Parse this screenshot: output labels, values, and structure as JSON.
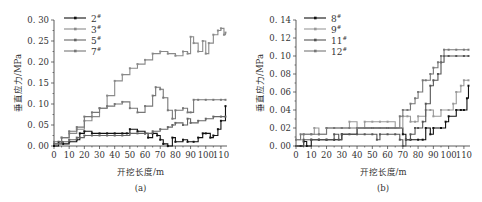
{
  "chart_data": [
    {
      "type": "line",
      "panel": "a",
      "caption": "(a)",
      "title": "",
      "xlabel": "开挖长度/m",
      "ylabel": "垂直应力/MPa",
      "xlim": [
        0,
        114
      ],
      "ylim": [
        0,
        0.3
      ],
      "xticks": [
        0,
        10,
        20,
        30,
        40,
        50,
        60,
        70,
        80,
        90,
        100,
        110
      ],
      "yticks": [
        "0.00",
        "0.05",
        "0.10",
        "0.15",
        "0.20",
        "0.25",
        "0.30"
      ],
      "grid": false,
      "legend_position": "upper-left",
      "series": [
        {
          "name": "2#",
          "color": "#111111",
          "marker": "square",
          "x": [
            0,
            3,
            6,
            10,
            15,
            17,
            20,
            25,
            30,
            35,
            40,
            45,
            48,
            50,
            55,
            60,
            62,
            65,
            68,
            70,
            72,
            75,
            78,
            80,
            85,
            88,
            92,
            95,
            98,
            100,
            103,
            105,
            108,
            110,
            113
          ],
          "y": [
            0.0,
            0.01,
            0.005,
            0.01,
            0.015,
            0.03,
            0.035,
            0.03,
            0.03,
            0.03,
            0.03,
            0.03,
            0.03,
            0.04,
            0.035,
            0.03,
            0.02,
            0.03,
            0.025,
            0.015,
            0.005,
            0.0,
            0.02,
            0.01,
            0.015,
            0.01,
            0.01,
            0.02,
            0.03,
            0.03,
            0.02,
            0.025,
            0.04,
            0.06,
            0.095
          ]
        },
        {
          "name": "3#",
          "color": "#8a8a8a",
          "marker": "circle",
          "x": [
            0,
            5,
            10,
            15,
            20,
            25,
            30,
            35,
            40,
            45,
            50,
            55,
            60,
            65,
            70,
            75,
            80,
            85,
            88,
            90,
            92,
            95,
            98,
            100,
            102,
            105,
            108,
            110,
            112,
            113
          ],
          "y": [
            0.005,
            0.02,
            0.03,
            0.04,
            0.06,
            0.07,
            0.09,
            0.12,
            0.155,
            0.17,
            0.185,
            0.195,
            0.205,
            0.22,
            0.225,
            0.22,
            0.215,
            0.225,
            0.22,
            0.26,
            0.245,
            0.225,
            0.25,
            0.22,
            0.245,
            0.265,
            0.275,
            0.28,
            0.265,
            0.27
          ]
        },
        {
          "name": "5#",
          "color": "#666666",
          "marker": "triangle",
          "x": [
            0,
            5,
            10,
            15,
            17,
            20,
            25,
            30,
            35,
            40,
            45,
            50,
            55,
            60,
            65,
            70,
            75,
            78,
            80,
            85,
            88,
            90,
            95,
            100,
            105,
            110,
            113
          ],
          "y": [
            0.005,
            0.01,
            0.015,
            0.02,
            0.02,
            0.025,
            0.025,
            0.025,
            0.025,
            0.025,
            0.025,
            0.03,
            0.03,
            0.03,
            0.035,
            0.04,
            0.045,
            0.05,
            0.055,
            0.05,
            0.065,
            0.055,
            0.06,
            0.065,
            0.07,
            0.07,
            0.07
          ]
        },
        {
          "name": "7#",
          "color": "#777777",
          "marker": "down-triangle",
          "x": [
            0,
            5,
            10,
            15,
            20,
            25,
            30,
            35,
            40,
            45,
            50,
            55,
            60,
            65,
            67,
            70,
            72,
            75,
            78,
            80,
            85,
            88,
            90,
            92,
            95,
            100,
            105,
            110,
            113
          ],
          "y": [
            0.01,
            0.02,
            0.035,
            0.045,
            0.07,
            0.08,
            0.09,
            0.095,
            0.1,
            0.105,
            0.09,
            0.08,
            0.095,
            0.12,
            0.14,
            0.135,
            0.115,
            0.085,
            0.065,
            0.085,
            0.09,
            0.08,
            0.08,
            0.11,
            0.11,
            0.11,
            0.11,
            0.11,
            0.11
          ]
        }
      ]
    },
    {
      "type": "line",
      "panel": "b",
      "caption": "(b)",
      "title": "",
      "xlabel": "开挖长度/m",
      "ylabel": "垂直应力/MPa",
      "xlim": [
        0,
        114
      ],
      "ylim": [
        0,
        0.14
      ],
      "xticks": [
        0,
        10,
        20,
        30,
        40,
        50,
        60,
        70,
        80,
        90,
        100,
        110
      ],
      "yticks": [
        "0.00",
        "0.02",
        "0.04",
        "0.06",
        "0.08",
        "0.10",
        "0.12",
        "0.14"
      ],
      "grid": false,
      "legend_position": "upper-left",
      "series": [
        {
          "name": "8#",
          "color": "#111111",
          "marker": "square",
          "x": [
            0,
            3,
            5,
            7,
            10,
            15,
            20,
            25,
            30,
            40,
            50,
            55,
            60,
            65,
            70,
            72,
            75,
            80,
            83,
            85,
            88,
            90,
            95,
            98,
            100,
            105,
            108,
            110,
            112,
            113
          ],
          "y": [
            0.0,
            0.0,
            0.005,
            0.0,
            0.007,
            0.007,
            0.007,
            0.007,
            0.013,
            0.02,
            0.02,
            0.02,
            0.02,
            0.02,
            0.013,
            0.007,
            0.007,
            0.007,
            0.007,
            0.02,
            0.013,
            0.02,
            0.02,
            0.027,
            0.033,
            0.04,
            0.04,
            0.04,
            0.053,
            0.067
          ]
        },
        {
          "name": "9#",
          "color": "#999999",
          "marker": "circle",
          "x": [
            0,
            5,
            10,
            12,
            15,
            20,
            25,
            30,
            35,
            40,
            45,
            50,
            55,
            60,
            65,
            68,
            70,
            73,
            75,
            78,
            80,
            85,
            88,
            90,
            95,
            100,
            103,
            105,
            108,
            110,
            113
          ],
          "y": [
            0.007,
            0.013,
            0.013,
            0.02,
            0.013,
            0.02,
            0.02,
            0.02,
            0.027,
            0.02,
            0.027,
            0.027,
            0.027,
            0.027,
            0.02,
            0.02,
            0.033,
            0.033,
            0.027,
            0.027,
            0.033,
            0.04,
            0.04,
            0.033,
            0.04,
            0.04,
            0.047,
            0.06,
            0.067,
            0.073,
            0.073
          ]
        },
        {
          "name": "11#",
          "color": "#555555",
          "marker": "triangle",
          "x": [
            0,
            5,
            10,
            15,
            20,
            25,
            28,
            30,
            35,
            40,
            45,
            50,
            53,
            55,
            60,
            65,
            68,
            70,
            72,
            75,
            78,
            80,
            83,
            85,
            88,
            90,
            93,
            95,
            97,
            100,
            105,
            110,
            113
          ],
          "y": [
            0.0,
            0.007,
            0.007,
            0.007,
            0.007,
            0.013,
            0.007,
            0.013,
            0.013,
            0.013,
            0.013,
            0.013,
            0.007,
            0.013,
            0.013,
            0.013,
            0.007,
            0.0,
            0.007,
            0.013,
            0.02,
            0.02,
            0.027,
            0.047,
            0.067,
            0.073,
            0.08,
            0.093,
            0.1,
            0.1,
            0.1,
            0.1,
            0.1
          ]
        },
        {
          "name": "12#",
          "color": "#777777",
          "marker": "down-triangle",
          "x": [
            0,
            3,
            5,
            10,
            15,
            20,
            25,
            30,
            35,
            40,
            45,
            50,
            55,
            60,
            65,
            68,
            70,
            73,
            75,
            78,
            80,
            83,
            85,
            88,
            90,
            93,
            95,
            97,
            100,
            105,
            110,
            113
          ],
          "y": [
            0.007,
            0.013,
            0.013,
            0.013,
            0.013,
            0.02,
            0.02,
            0.02,
            0.02,
            0.02,
            0.02,
            0.02,
            0.02,
            0.02,
            0.02,
            0.033,
            0.04,
            0.04,
            0.047,
            0.053,
            0.06,
            0.073,
            0.073,
            0.08,
            0.087,
            0.093,
            0.1,
            0.107,
            0.107,
            0.107,
            0.107,
            0.107
          ]
        }
      ]
    }
  ]
}
